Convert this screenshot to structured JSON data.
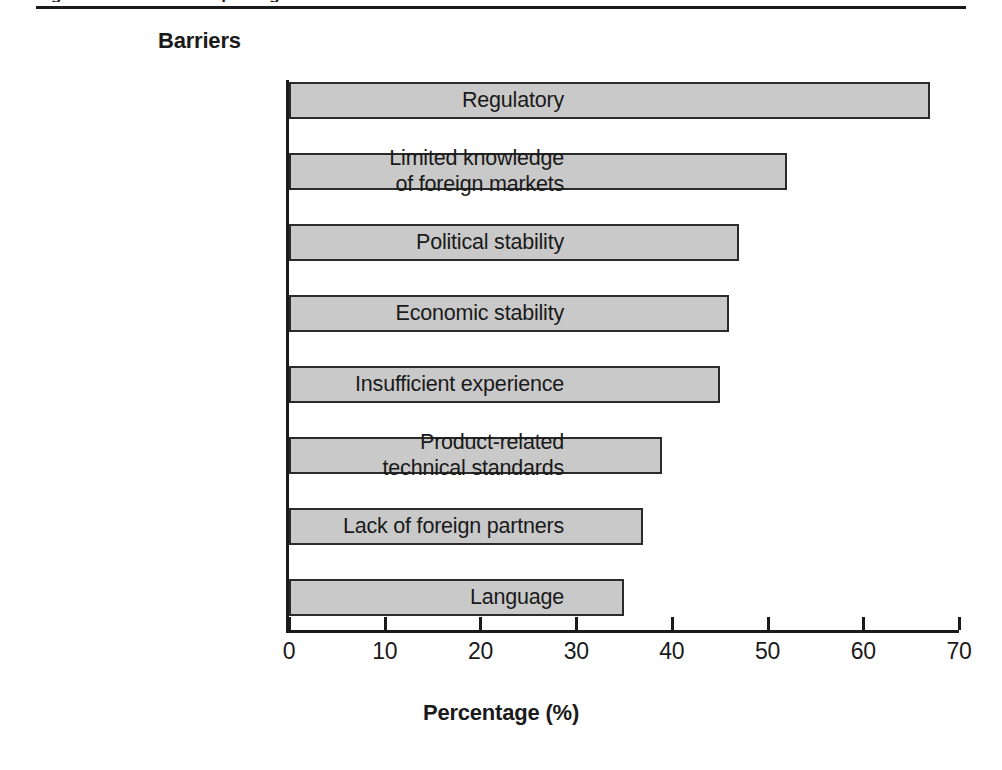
{
  "figure": {
    "cut_caption": "Figure 1.  Barriers to exporting",
    "axis_group_title": "Barriers",
    "x_axis_title": "Percentage (%)"
  },
  "chart_data": {
    "type": "bar",
    "orientation": "horizontal",
    "title": "",
    "subtitle": "",
    "xlabel": "Percentage (%)",
    "ylabel": "Barriers",
    "xlim": [
      0,
      70
    ],
    "xticks": [
      0,
      10,
      20,
      30,
      40,
      50,
      60,
      70
    ],
    "xtick_labels": [
      "0",
      "10",
      "20",
      "30",
      "40",
      "50",
      "60",
      "70"
    ],
    "grid": false,
    "legend": false,
    "bar_fill_color": "#c9c9c9",
    "bar_border_color": "#2b2b2b",
    "categories": [
      "Regulatory",
      "Limited knowledge\nof foreign markets",
      "Political stability",
      "Economic stability",
      "Insufficient experience",
      "Product-related\ntechnical standards",
      "Lack of foreign partners",
      "Language"
    ],
    "values": [
      67,
      52,
      47,
      46,
      45,
      39,
      37,
      35
    ]
  }
}
